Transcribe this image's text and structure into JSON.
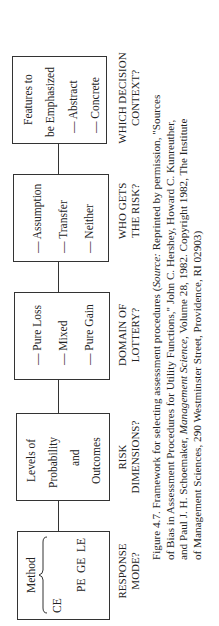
{
  "figure": {
    "boxes": [
      {
        "id": "response-mode",
        "method_items": [
          "CE",
          "PE",
          "GE",
          "LE"
        ],
        "method_label": "Method",
        "question": [
          "RESPONSE",
          "MODE?"
        ]
      },
      {
        "id": "risk-dimensions",
        "lines": [
          "Levels of",
          "Probability",
          "and",
          "Outcomes"
        ],
        "question": [
          "RISK",
          "DIMENSIONS?"
        ]
      },
      {
        "id": "domain-of-lottery",
        "lines": [
          "— Pure Loss",
          "— Mixed",
          "— Pure Gain"
        ],
        "question": [
          "DOMAIN OF",
          "LOTTERY?"
        ]
      },
      {
        "id": "who-gets-risk",
        "lines": [
          "— Assumption",
          "— Transfer",
          "— Neither"
        ],
        "question": [
          "WHO GETS",
          "THE RISK?"
        ]
      },
      {
        "id": "decision-context",
        "lines": [
          "Features to",
          "be Emphasized",
          "— Abstract",
          "— Concrete"
        ],
        "question": [
          "WHICH DECISION",
          "CONTEXT?"
        ]
      }
    ]
  },
  "caption": {
    "line1_a": "Figure 4.7. Framework for selecting assessment procedures (",
    "line1_source": "Source:",
    "line1_b": " Reprinted by permission, \"Sources",
    "line2": "of Bias in Assessment Procedures for Utility Functions,\" John C. Hershey, Howard C. Kunreuther,",
    "line3_a": "and Paul J. H. Schoemaker, ",
    "line3_journal": "Management Science,",
    "line3_b": " Volume 28, 1982. Copyright 1982, The Institute",
    "line4": "of Management Sciences, 290 Westminster Street, Providence, RI 02903)"
  }
}
